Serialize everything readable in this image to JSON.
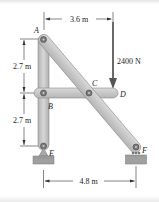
{
  "figure": {
    "points": {
      "A": "A",
      "B": "B",
      "C": "C",
      "D": "D",
      "E": "E",
      "F": "F"
    },
    "dimensions": {
      "top": "3.6 m",
      "left_upper": "2.7 m",
      "left_lower": "2.7 m",
      "bottom": "4.8 m"
    },
    "load": {
      "label": "2400 N",
      "direction": "down"
    },
    "members": [
      "AE",
      "AF",
      "BD"
    ],
    "supports": {
      "E": "pin",
      "F": "roller"
    },
    "colors": {
      "member_fill": "#c9c9c9",
      "member_stroke": "#8a8a8a",
      "pin": "#6e6e6e",
      "ground": "#9a9a9a",
      "dim_line": "#333333"
    }
  }
}
